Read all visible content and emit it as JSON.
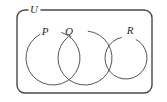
{
  "figure": {
    "kind": "venn-diagram",
    "background_color": "#ffffff",
    "stroke_color": "#555555",
    "frame_color": "#4a4a4a",
    "label_color": "#2b2b2b"
  },
  "universe": {
    "label": "U",
    "label_x": 34,
    "label_y": 10,
    "frame": {
      "x": 17,
      "y": 10,
      "width": 135,
      "height": 83,
      "corner_radius": 8
    },
    "label_gap": {
      "start_x": 28,
      "end_x": 41
    }
  },
  "sets": [
    {
      "id": "P",
      "label": "P",
      "cx": 53,
      "cy": 58,
      "r": 27,
      "label_x": 45,
      "label_y": 32,
      "label_gap_degrees": {
        "start": -118,
        "end": -72
      }
    },
    {
      "id": "Q",
      "label": "Q",
      "cx": 85,
      "cy": 58,
      "r": 27,
      "label_x": 69,
      "label_y": 32,
      "label_gap_degrees": {
        "start": -128,
        "end": -84
      }
    },
    {
      "id": "R",
      "label": "R",
      "cx": 126,
      "cy": 58,
      "r": 21,
      "label_x": 130,
      "label_y": 31,
      "label_gap_degrees": {
        "start": -102,
        "end": -62
      }
    }
  ]
}
